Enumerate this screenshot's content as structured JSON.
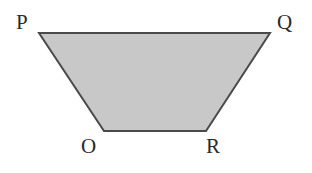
{
  "diagram": {
    "type": "trapezoid",
    "fill_color": "#c8c8c8",
    "stroke_color": "#4a4a4a",
    "vertices": [
      {
        "name": "P",
        "x": 39,
        "y": 33
      },
      {
        "name": "Q",
        "x": 270,
        "y": 33
      },
      {
        "name": "R",
        "x": 206,
        "y": 131
      },
      {
        "name": "O",
        "x": 104,
        "y": 131
      }
    ],
    "labels": {
      "P": "P",
      "Q": "Q",
      "R": "R",
      "O": "O"
    }
  }
}
